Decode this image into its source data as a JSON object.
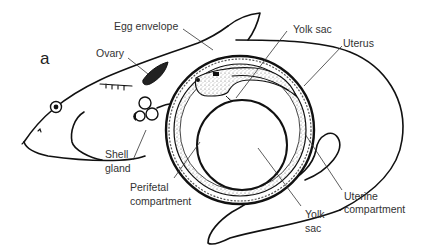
{
  "figure": {
    "panel_letter": "a",
    "colors": {
      "background": "#ffffff",
      "line": "#111111",
      "label_text": "#333333",
      "stipple": "#777777"
    },
    "labels": {
      "egg_envelope": "Egg envelope",
      "ovary": "Ovary",
      "yolk_sac_top": "Yolk sac",
      "uterus": "Uterus",
      "shell_gland_line1": "Shell",
      "shell_gland_line2": "gland",
      "perifetal_line1": "Perifetal",
      "perifetal_line2": "compartment",
      "uterine_line1": "Uterine",
      "uterine_line2": "compartment",
      "yolk_sac_bottom_line1": "Yolk",
      "yolk_sac_bottom_line2": "sac"
    }
  }
}
